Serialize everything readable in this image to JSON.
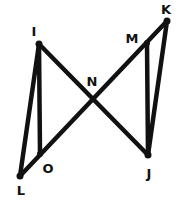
{
  "diagram": {
    "type": "geometry",
    "points": [
      {
        "id": "I",
        "label": "I",
        "x": 39,
        "y": 44,
        "lx": 34,
        "ly": 31
      },
      {
        "id": "K",
        "label": "K",
        "x": 167,
        "y": 21,
        "lx": 166,
        "ly": 9
      },
      {
        "id": "M",
        "label": "M",
        "x": 147,
        "y": 43,
        "lx": 132,
        "ly": 38
      },
      {
        "id": "N",
        "label": "N",
        "x": 93,
        "y": 99,
        "lx": 92,
        "ly": 81
      },
      {
        "id": "L",
        "label": "L",
        "x": 20,
        "y": 176,
        "lx": 21,
        "ly": 190
      },
      {
        "id": "O",
        "label": "O",
        "x": 40,
        "y": 154,
        "lx": 48,
        "ly": 168
      },
      {
        "id": "J",
        "label": "J",
        "x": 148,
        "y": 155,
        "lx": 149,
        "ly": 173
      }
    ],
    "segments": [
      [
        "I",
        "L"
      ],
      [
        "I",
        "O"
      ],
      [
        "I",
        "J"
      ],
      [
        "L",
        "K"
      ],
      [
        "M",
        "J"
      ],
      [
        "K",
        "J"
      ]
    ],
    "colors": {
      "stroke": "#111111",
      "background": "#ffffff"
    }
  },
  "labels": {
    "I": "I",
    "K": "K",
    "M": "M",
    "N": "N",
    "L": "L",
    "O": "O",
    "J": "J"
  }
}
